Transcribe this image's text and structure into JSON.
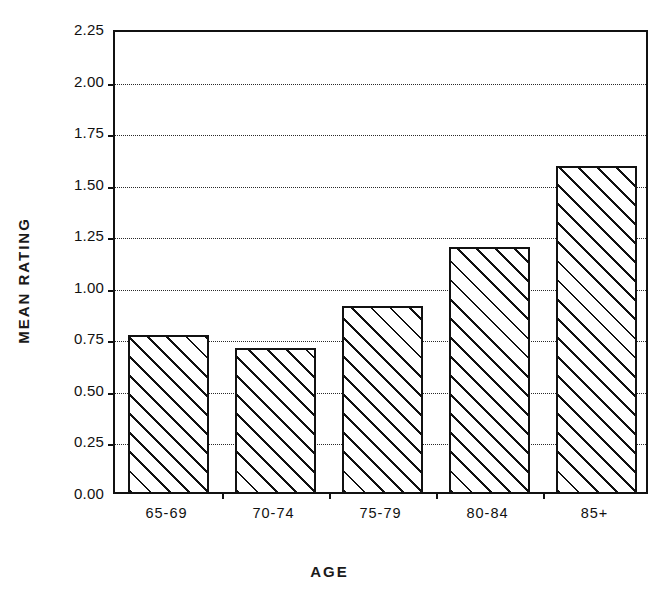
{
  "chart_data": {
    "type": "bar",
    "title": "",
    "subtitle": "",
    "xlabel": "AGE",
    "ylabel": "MEAN RATING",
    "categories": [
      "65-69",
      "70-74",
      "75-79",
      "80-84",
      "85+"
    ],
    "values": [
      0.76,
      0.7,
      0.9,
      1.19,
      1.58
    ],
    "series": [
      {
        "name": "Mean rating",
        "values": [
          0.76,
          0.7,
          0.9,
          1.19,
          1.58
        ]
      }
    ],
    "ylim": [
      0.0,
      2.25
    ],
    "xlim": [
      0,
      5
    ],
    "ytick_values": [
      0.0,
      0.25,
      0.5,
      0.75,
      1.0,
      1.25,
      1.5,
      1.75,
      2.0,
      2.25
    ],
    "ytick_labels": [
      "0.00",
      "0.25",
      "0.50",
      "0.75",
      "1.00",
      "1.25",
      "1.50",
      "1.75",
      "2.00",
      "2.25"
    ],
    "xtick_labels": [
      "65-69",
      "70-74",
      "75-79",
      "80-84",
      "85+"
    ],
    "grid": true,
    "grid_axis": "y",
    "grid_style": "dotted",
    "legend": false,
    "legend_position": "none",
    "bar_fill": "diagonal-hatch",
    "bar_fill_color": "#ffffff",
    "bar_edge_color": "#111111",
    "axis_color": "#111111",
    "background_color": "#ffffff",
    "annotations": []
  }
}
